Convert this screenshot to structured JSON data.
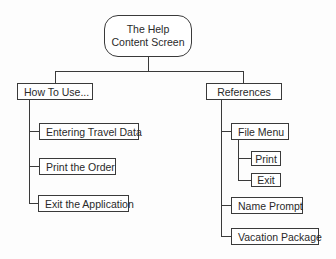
{
  "diagram": {
    "root": {
      "line1": "The Help",
      "line2": "Content Screen"
    },
    "branches": [
      {
        "label": "How To Use...",
        "children": [
          {
            "label": "Entering Travel Data"
          },
          {
            "label": "Print the Order"
          },
          {
            "label": "Exit the Application"
          }
        ]
      },
      {
        "label": "References",
        "children": [
          {
            "label": "File Menu",
            "children": [
              {
                "label": "Print"
              },
              {
                "label": "Exit"
              }
            ]
          },
          {
            "label": "Name Prompt"
          },
          {
            "label": "Vacation Package"
          }
        ]
      }
    ]
  },
  "colors": {
    "line": "#3a3a3a",
    "box_fill": "#ffffff",
    "text": "#2a2a2a"
  }
}
